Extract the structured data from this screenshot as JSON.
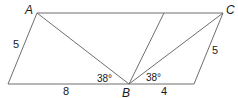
{
  "diagram": {
    "type": "geometry",
    "vertices": {
      "A": {
        "label": "A"
      },
      "B": {
        "label": "B"
      },
      "C": {
        "label": "C"
      }
    },
    "side_lengths": {
      "left_side": "5",
      "right_side": "5",
      "bottom_left": "8",
      "bottom_right": "4"
    },
    "angles": {
      "angle_ABleft": "38°",
      "angle_CBright": "38°"
    },
    "colors": {
      "line": "#6e6e6e",
      "text": "#1a1a1a",
      "background": "#ffffff"
    }
  }
}
